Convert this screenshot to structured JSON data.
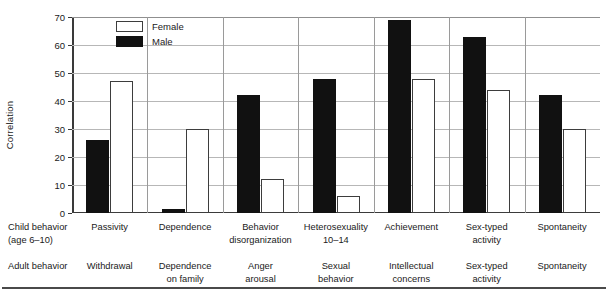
{
  "chart_data": {
    "type": "bar",
    "title": "",
    "xlabel": "",
    "ylabel": "Correlation",
    "ylim": [
      0,
      70
    ],
    "yticks": [
      0,
      10,
      20,
      30,
      40,
      50,
      60,
      70
    ],
    "grid": true,
    "legend_position": "top-left",
    "categories": [
      "Passivity",
      "Dependence",
      "Behavior disorganization",
      "Heterosexuality 10–14",
      "Achievement",
      "Sex-typed activity",
      "Spontaneity"
    ],
    "series": [
      {
        "name": "Female",
        "style": "open",
        "values": [
          47,
          30,
          12,
          6,
          48,
          44,
          30
        ]
      },
      {
        "name": "Male",
        "style": "filled",
        "values": [
          26,
          1.5,
          42,
          48,
          69,
          63,
          42
        ]
      }
    ],
    "groups": [
      {
        "child_behavior": [
          "Passivity"
        ],
        "adult_behavior": [
          "Withdrawal"
        ],
        "female": 47,
        "male": 26
      },
      {
        "child_behavior": [
          "Dependence"
        ],
        "adult_behavior": [
          "Dependence",
          "on family"
        ],
        "female": 30,
        "male": 1.5
      },
      {
        "child_behavior": [
          "Behavior",
          "disorganization"
        ],
        "adult_behavior": [
          "Anger",
          "arousal"
        ],
        "female": 12,
        "male": 42
      },
      {
        "child_behavior": [
          "Heterosexuality",
          "10–14"
        ],
        "adult_behavior": [
          "Sexual",
          "behavior"
        ],
        "female": 6,
        "male": 48
      },
      {
        "child_behavior": [
          "Achievement"
        ],
        "adult_behavior": [
          "Intellectual",
          "concerns"
        ],
        "female": 48,
        "male": 69
      },
      {
        "child_behavior": [
          "Sex-typed",
          "activity"
        ],
        "adult_behavior": [
          "Sex-typed",
          "activity"
        ],
        "female": 44,
        "male": 63
      },
      {
        "child_behavior": [
          "Spontaneity"
        ],
        "adult_behavior": [
          "Spontaneity"
        ],
        "female": 30,
        "male": 42
      }
    ]
  },
  "axis": {
    "y_title": "Correlation",
    "tick_labels": [
      "70",
      "60",
      "50",
      "40",
      "30",
      "20",
      "10",
      "0"
    ]
  },
  "legend": {
    "items": [
      {
        "label": "Female",
        "swatch": "open-square-icon"
      },
      {
        "label": "Male",
        "swatch": "filled-square-icon"
      }
    ]
  },
  "label_table": {
    "row_child_header": [
      "Child behavior",
      "(age 6–10)"
    ],
    "row_adult_header": [
      "Adult behavior"
    ],
    "child_cells": [
      [
        "Passivity"
      ],
      [
        "Dependence"
      ],
      [
        "Behavior",
        "disorganization"
      ],
      [
        "Heterosexuality",
        "10–14"
      ],
      [
        "Achievement"
      ],
      [
        "Sex-typed",
        "activity"
      ],
      [
        "Spontaneity"
      ]
    ],
    "adult_cells": [
      [
        "Withdrawal"
      ],
      [
        "Dependence",
        "on family"
      ],
      [
        "Anger",
        "arousal"
      ],
      [
        "Sexual",
        "behavior"
      ],
      [
        "Intellectual",
        "concerns"
      ],
      [
        "Sex-typed",
        "activity"
      ],
      [
        "Spontaneity"
      ]
    ]
  },
  "colors": {
    "male_fill": "#111111",
    "female_fill": "#ffffff",
    "female_stroke": "#3d3d3d",
    "gridline": "#b7b7b7",
    "axis": "#3a3a3a",
    "text": "#1a1a1a"
  }
}
